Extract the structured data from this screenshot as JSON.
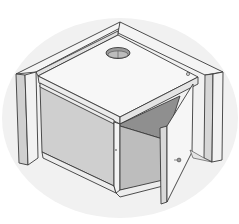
{
  "figure": {
    "labels": []
  },
  "colors": {
    "background": "#ffffff",
    "shadow_blob": "#efefef",
    "outline": "#3a3a3a",
    "light_face": "#f6f6f6",
    "mid_face": "#dcdcdc",
    "dark_face": "#b9b9b9",
    "interior_dark": "#8f8f8f",
    "hole_fill": "#9a9a9a"
  }
}
